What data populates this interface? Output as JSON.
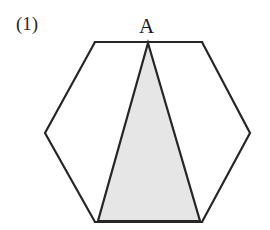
{
  "figure": {
    "number_label": "(1)",
    "caption": "",
    "background_color": "#ffffff"
  },
  "labels": [
    {
      "id": "A",
      "text": "A",
      "x": 148,
      "y": 30,
      "description": "apex-vertex-label"
    }
  ],
  "shapes": {
    "hexagon": {
      "name": "regular-hexagon",
      "stroke_color": "#262626",
      "stroke_width": 2.2,
      "fill_color": "#ffffff",
      "points": "95,42 202,42 250,133 202,222 95,222 45,133",
      "vertices": [
        {
          "x": 95,
          "y": 42
        },
        {
          "x": 202,
          "y": 42
        },
        {
          "x": 250,
          "y": 133
        },
        {
          "x": 202,
          "y": 222
        },
        {
          "x": 95,
          "y": 222
        },
        {
          "x": 45,
          "y": 133
        }
      ]
    },
    "triangle": {
      "name": "shaded-triangle",
      "stroke_color": "#262626",
      "stroke_width": 2.2,
      "fill_color": "#e6e6e6",
      "points": "148,43 200,221 98,221",
      "vertices": [
        {
          "x": 148,
          "y": 43,
          "label": "A"
        },
        {
          "x": 200,
          "y": 221,
          "label": ""
        },
        {
          "x": 98,
          "y": 221,
          "label": ""
        }
      ]
    }
  },
  "colors": {
    "ink": "#262626",
    "shade": "#e6e6e6",
    "paper": "#ffffff",
    "label_ink": "#1c1c1c"
  }
}
